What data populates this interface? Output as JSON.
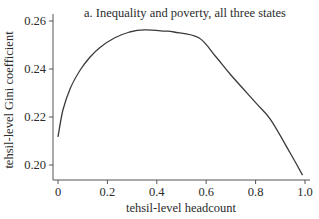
{
  "chart_data": {
    "type": "line",
    "title": "a. Inequality and poverty, all three states",
    "xlabel": "tehsil-level headcount",
    "ylabel": "tehsil-level Gini coefficient",
    "xlim": [
      0,
      1.0
    ],
    "ylim": [
      0.193,
      0.262
    ],
    "x_ticks": [
      0,
      0.2,
      0.4,
      0.6,
      0.8,
      1.0
    ],
    "x_tick_labels": [
      "0",
      "0.2",
      "0.4",
      "0.6",
      "0.8",
      "1.0"
    ],
    "y_ticks": [
      0.2,
      0.22,
      0.24,
      0.26
    ],
    "y_tick_labels": [
      "0.20",
      "0.22",
      "0.24",
      "0.26"
    ],
    "grid": false,
    "legend": null,
    "series": [
      {
        "name": "Gini vs headcount",
        "color": "#3a3a3a",
        "x": [
          0.0,
          0.02,
          0.05,
          0.09,
          0.13,
          0.17,
          0.23,
          0.29,
          0.35,
          0.43,
          0.47,
          0.57,
          0.64,
          0.7,
          0.8,
          0.86,
          0.94,
          0.99
        ],
        "y": [
          0.2117,
          0.2229,
          0.232,
          0.2396,
          0.245,
          0.249,
          0.253,
          0.2554,
          0.2563,
          0.2558,
          0.2554,
          0.253,
          0.245,
          0.2375,
          0.226,
          0.219,
          0.205,
          0.1958
        ]
      }
    ]
  }
}
